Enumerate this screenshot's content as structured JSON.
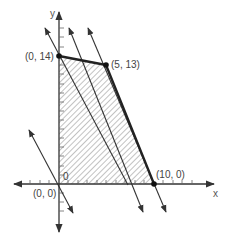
{
  "diagram": {
    "type": "linear-programming-feasible-region",
    "axes": {
      "x_label": "x",
      "y_label": "y",
      "origin_tick_label": "0"
    },
    "vertices": [
      {
        "label": "(0, 0)",
        "x": 0,
        "y": 0
      },
      {
        "label": "(0, 14)",
        "x": 0,
        "y": 14
      },
      {
        "label": "(5, 13)",
        "x": 5,
        "y": 13
      },
      {
        "label": "(10, 0)",
        "x": 10,
        "y": 0
      }
    ],
    "feasible_region": {
      "fill": "hatched",
      "boundary_color": "#222222"
    },
    "objective_lines": {
      "count": 4,
      "style": "parallel double-headed arrows",
      "color": "#333333"
    }
  }
}
